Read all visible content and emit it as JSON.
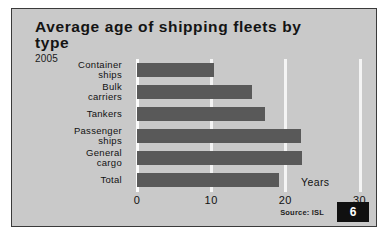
{
  "figure": {
    "title": "Average age of shipping fleets by type",
    "subtitle": "2005",
    "units_label": "Years",
    "source": "Source: ISL",
    "page_number": "6",
    "colors": {
      "panel_background": "#c9c9c9",
      "bar_fill": "#595959",
      "gridline": "#f4f4f4",
      "text": "#111111",
      "badge_background": "#101010",
      "badge_text": "#ffffff",
      "border": "#3a3a3a"
    }
  },
  "chart_data": {
    "type": "bar",
    "orientation": "horizontal",
    "title": "Average age of shipping fleets by type",
    "subtitle": "2005",
    "xlabel": "Years",
    "ylabel": "",
    "categories": [
      "Container ships",
      "Bulk carriers",
      "Tankers",
      "Passenger ships",
      "General cargo",
      "Total"
    ],
    "values": [
      10.4,
      15.5,
      17.3,
      22.1,
      22.3,
      19.1
    ],
    "xlim": [
      0,
      31
    ],
    "xticks": [
      0,
      10,
      20,
      30
    ],
    "xtick_labels": [
      "0",
      "10",
      "20",
      "30"
    ],
    "grid": true,
    "grid_axis": "x",
    "legend": false,
    "annotations": [
      "Years",
      "Source: ISL"
    ]
  }
}
